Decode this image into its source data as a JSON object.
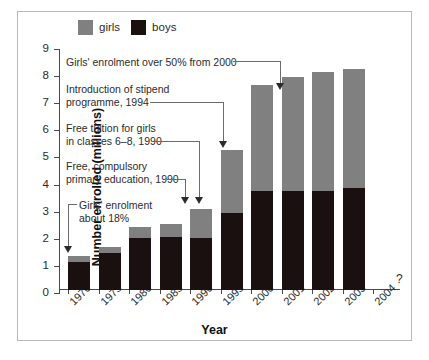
{
  "legend": {
    "items": [
      {
        "label": "girls",
        "color": "#808080",
        "icon": "square-swatch-icon"
      },
      {
        "label": "boys",
        "color": "#1a1010",
        "icon": "square-swatch-icon"
      }
    ]
  },
  "axes": {
    "ylabel": "Number enrolled (millions)",
    "xlabel": "Year",
    "yticks": [
      "0",
      "1",
      "2",
      "3",
      "4",
      "5",
      "6",
      "7",
      "8",
      "9"
    ],
    "xticks": [
      "1970",
      "1975",
      "1980",
      "1985",
      "1990",
      "1995",
      "2000",
      "2001",
      "2002",
      "2003",
      "2004"
    ]
  },
  "marks": {
    "question_mark": "?"
  },
  "annotations": [
    {
      "id": "a1",
      "text": "Girls' enrolment over 50% from 2000",
      "target": "2000"
    },
    {
      "id": "a2",
      "text": "Introduction of stipend\nprogramme, 1994",
      "target": "1995"
    },
    {
      "id": "a3",
      "text": "Free tuition for girls\nin classes 6–8, 1990",
      "target": "1990"
    },
    {
      "id": "a4",
      "text": "Free, compulsory\nprimary education, 1990",
      "target": "1990"
    },
    {
      "id": "a5",
      "text": "Girls' enrolment\nabout 18%",
      "target": "1970"
    }
  ],
  "chart_data": {
    "type": "bar",
    "stacked": true,
    "title": "",
    "xlabel": "Year",
    "ylabel": "Number enrolled (millions)",
    "ylim": [
      0,
      9
    ],
    "grid": false,
    "legend_position": "top",
    "categories": [
      "1970",
      "1975",
      "1980",
      "1985",
      "1990",
      "1995",
      "2000",
      "2001",
      "2002",
      "2003",
      "2004"
    ],
    "series": [
      {
        "name": "boys",
        "color": "#1a1010",
        "values": [
          1.05,
          1.36,
          1.92,
          1.96,
          1.93,
          2.83,
          3.65,
          3.65,
          3.65,
          3.75,
          null
        ]
      },
      {
        "name": "girls",
        "color": "#808080",
        "values": [
          0.2,
          0.23,
          0.42,
          0.49,
          1.05,
          2.34,
          3.9,
          4.2,
          4.39,
          4.4,
          null
        ]
      }
    ],
    "totals": [
      1.25,
      1.59,
      2.34,
      2.45,
      2.98,
      5.17,
      7.55,
      7.85,
      8.04,
      8.15,
      null
    ],
    "notes": [
      "2004 has no bar; marked with '?'",
      "Girls' enrolment about 18% in 1970",
      "Girls' enrolment over 50% from 2000"
    ]
  }
}
